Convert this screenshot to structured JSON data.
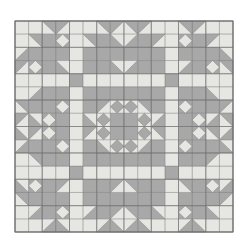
{
  "figure": {
    "name": "patchwork-quilt-pattern",
    "title": "Geometric patchwork quilt block pattern",
    "background_color": "#ffffff"
  },
  "canvas": {
    "width": 249,
    "height": 249
  },
  "quilt": {
    "x": 15,
    "y": 21,
    "width": 218,
    "height": 211,
    "blocks_across": 2,
    "blocks_down": 2,
    "grid_units_per_block": 8,
    "border_color": "#6b6b6b",
    "border_width": 1
  },
  "colors": {
    "light": "#e6e6e2",
    "medium": "#a8a8a8",
    "line": "#6e6e6e",
    "background": "#ffffff"
  },
  "chart_data": {
    "type": "heatmap",
    "title": "Geometric patchwork quilt block pattern",
    "xlabel": "",
    "ylabel": "",
    "grid": true,
    "legend": "none",
    "categories": [
      "light",
      "medium"
    ],
    "values": [
      2,
      1
    ],
    "block_unit_patches": [
      {
        "unit": "corner-square",
        "fill": "light"
      },
      {
        "unit": "corner-half-square-triangle",
        "fill": "medium"
      },
      {
        "unit": "flying-geese",
        "fill": "medium"
      },
      {
        "unit": "sashing-bar",
        "fill": "light"
      },
      {
        "unit": "sashing-center-square",
        "fill": "medium"
      },
      {
        "unit": "large-star-triangle",
        "fill": "medium"
      },
      {
        "unit": "center-diamond-square",
        "fill": "light"
      },
      {
        "unit": "center-diamond-corner",
        "fill": "medium"
      },
      {
        "unit": "small-on-point-diamond",
        "fill": "light"
      }
    ]
  }
}
